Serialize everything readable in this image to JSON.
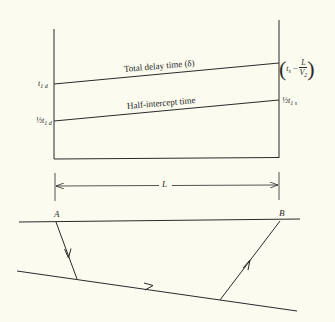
{
  "figure": {
    "background_color": "#fbfbef",
    "line_color": "#2a2a2a",
    "time_diagram": {
      "line_labels": {
        "total_delay": "Total delay time (δ)",
        "half_intercept": "Half-intercept time"
      },
      "left_labels": {
        "t_prefix": "t",
        "t_sub": "1 d",
        "half_prefix": "½t",
        "half_sub": "1 d"
      },
      "right_labels": {
        "open_paren": "(",
        "t_prefix": "t",
        "t_sub": "s",
        "minus": " − ",
        "frac_num": "L",
        "frac_den_prefix": "V",
        "frac_den_sub": "2",
        "close_paren": ")",
        "half_prefix": "½t",
        "half_sub": "1 s"
      }
    },
    "dimension": {
      "label": "L"
    },
    "ray_diagram": {
      "point_a": "A",
      "point_b": "B"
    }
  }
}
